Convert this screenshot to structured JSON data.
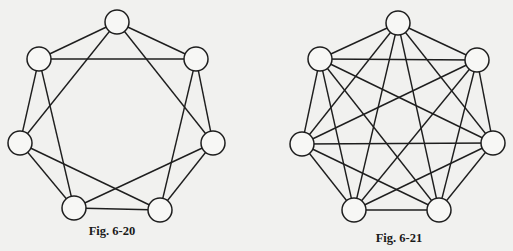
{
  "style": {
    "background": "#f1f1ef",
    "stroke": "#1e1e1e",
    "node_fill": "#f7f7f5",
    "node_radius": 12
  },
  "figures": [
    {
      "id": "fig-6-20",
      "caption": "Fig. 6-20",
      "caption_pos": [
        112,
        224
      ],
      "graph_type": "4-regular graph on 7 vertices",
      "nodes": [
        {
          "id": "top",
          "x": 117,
          "y": 22
        },
        {
          "id": "upper-right",
          "x": 196,
          "y": 59
        },
        {
          "id": "right",
          "x": 213,
          "y": 143
        },
        {
          "id": "bottom-right",
          "x": 160,
          "y": 210
        },
        {
          "id": "bottom-left",
          "x": 74,
          "y": 208
        },
        {
          "id": "left",
          "x": 20,
          "y": 143
        },
        {
          "id": "upper-left",
          "x": 39,
          "y": 59
        }
      ],
      "edges": [
        [
          "top",
          "upper-left"
        ],
        [
          "top",
          "upper-right"
        ],
        [
          "top",
          "left"
        ],
        [
          "top",
          "right"
        ],
        [
          "upper-left",
          "upper-right"
        ],
        [
          "upper-left",
          "left"
        ],
        [
          "upper-left",
          "bottom-left"
        ],
        [
          "upper-right",
          "right"
        ],
        [
          "upper-right",
          "bottom-right"
        ],
        [
          "left",
          "bottom-left"
        ],
        [
          "left",
          "bottom-right"
        ],
        [
          "right",
          "bottom-right"
        ],
        [
          "right",
          "bottom-left"
        ],
        [
          "bottom-left",
          "bottom-right"
        ]
      ]
    },
    {
      "id": "fig-6-21",
      "caption": "Fig. 6-21",
      "caption_pos": [
        399,
        231
      ],
      "graph_type": "complete graph K7",
      "nodes": [
        {
          "id": "top",
          "x": 398,
          "y": 23
        },
        {
          "id": "upper-right",
          "x": 477,
          "y": 60
        },
        {
          "id": "right",
          "x": 493,
          "y": 143
        },
        {
          "id": "bottom-right",
          "x": 439,
          "y": 210
        },
        {
          "id": "bottom-left",
          "x": 354,
          "y": 210
        },
        {
          "id": "left",
          "x": 302,
          "y": 144
        },
        {
          "id": "upper-left",
          "x": 320,
          "y": 59
        }
      ],
      "edges": "all-pairs"
    }
  ]
}
